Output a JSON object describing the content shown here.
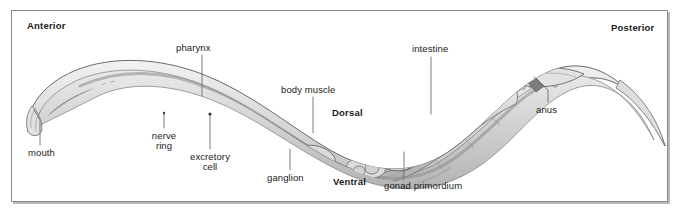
{
  "figure": {
    "orientation": {
      "anterior": "Anterior",
      "posterior": "Posterior",
      "dorsal": "Dorsal",
      "ventral": "Ventral"
    },
    "labels": [
      {
        "key": "mouth",
        "text": "mouth"
      },
      {
        "key": "pharynx",
        "text": "pharynx"
      },
      {
        "key": "nerve_ring_line1",
        "text": "nerve"
      },
      {
        "key": "nerve_ring_line2",
        "text": "ring"
      },
      {
        "key": "excretory_cell_line1",
        "text": "excretory"
      },
      {
        "key": "excretory_cell_line2",
        "text": "cell"
      },
      {
        "key": "ganglion",
        "text": "ganglion"
      },
      {
        "key": "body_muscle",
        "text": "body muscle"
      },
      {
        "key": "intestine",
        "text": "intestine"
      },
      {
        "key": "gonad_primordium",
        "text": "gonad primordium"
      },
      {
        "key": "anus",
        "text": "anus"
      }
    ],
    "colors": {
      "frame_border": "#8b8b8b",
      "frame_shadow": "#b9b9b9",
      "text": "#1a1a1a",
      "leader_line": "#6e6e6e",
      "cuticle": "#d6d4d2",
      "body_fill": "#c9c7c5",
      "pharynx_fill": "#b8b6b4",
      "intestine_fill": "#bfbdbb",
      "outline": "#6a6a6a",
      "background": "#ffffff"
    }
  }
}
